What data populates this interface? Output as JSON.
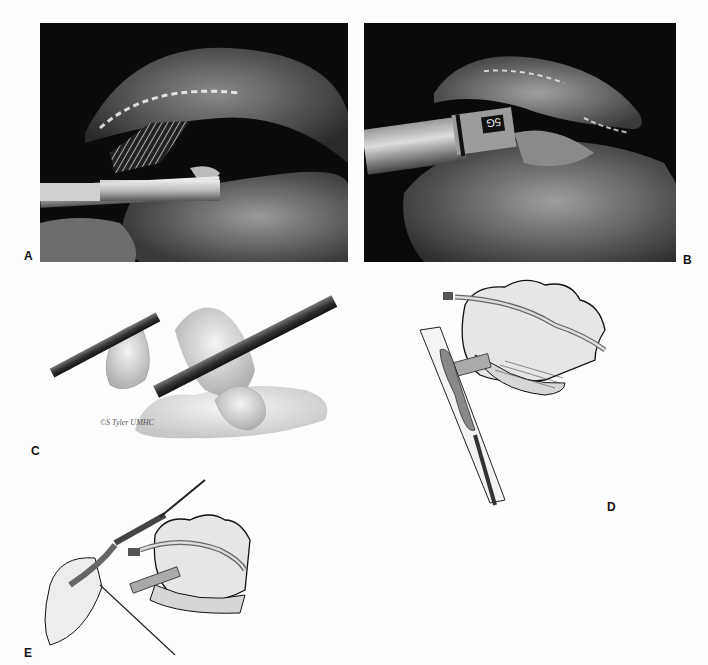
{
  "figure": {
    "panels": [
      {
        "id": "A",
        "label": "A",
        "type": "endoscopic-photo",
        "description": "laparoscopic view: stapler with mesh across appendix mesentery"
      },
      {
        "id": "B",
        "label": "B",
        "type": "endoscopic-photo",
        "description": "laparoscopic view: trocar port marked 5G beside bowel"
      },
      {
        "id": "C",
        "label": "C",
        "type": "illustration",
        "description": "graspers holding appendix above bowel loops",
        "credit": "©S Tyler UMHC"
      },
      {
        "id": "D",
        "label": "D",
        "type": "line-drawing",
        "description": "appendix pulled into trocar sheath beside cecum"
      },
      {
        "id": "E",
        "label": "E",
        "type": "line-drawing",
        "description": "appendix extracted through abdominal wall with needle and instrument"
      }
    ],
    "instrument_marking": "5G",
    "colors": {
      "background": "#fdfdfd",
      "photo_bg": "#0a0a0a",
      "ink": "#111111",
      "tissue_gray": "#cfcfcf"
    }
  }
}
